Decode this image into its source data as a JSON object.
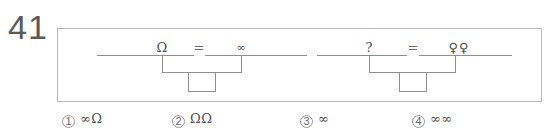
{
  "question": {
    "number": "41"
  },
  "stimulus": {
    "equations": [
      {
        "left_label": "Ω",
        "operator": "=",
        "right_label": "∞"
      },
      {
        "left_label": "?",
        "operator": "=",
        "right_label": "♀♀"
      }
    ]
  },
  "options": [
    {
      "number": "1",
      "value": "∞Ω"
    },
    {
      "number": "2",
      "value": "ΩΩ"
    },
    {
      "number": "3",
      "value": "∞"
    },
    {
      "number": "4",
      "value": "∞∞"
    }
  ],
  "colors": {
    "ink": "#4a4a4a",
    "border": "#b8b8b8",
    "diagram_line": "#8f8f8f"
  }
}
